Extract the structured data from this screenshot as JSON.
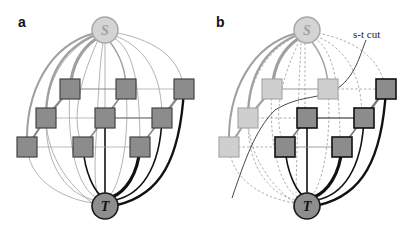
{
  "panels": [
    {
      "id": "a",
      "label": "a",
      "source_label": "S",
      "sink_label": "T",
      "description": "Graph with source S, sink T and a 3x3 grid of pixel nodes; edges to S drawn grey, edges to T drawn black, line thickness encodes edge weight"
    },
    {
      "id": "b",
      "label": "b",
      "source_label": "S",
      "sink_label": "T",
      "cut_label": "s-t cut",
      "description": "Same graph after an s-t cut: nodes on the source side are light grey, nodes on the sink side dark grey; cut edges drawn dashed"
    }
  ],
  "colors": {
    "source_fill": "#d4d4d4",
    "source_stroke": "#a8a8a8",
    "sink_fill": "#8e8e8e",
    "sink_stroke": "#1a1a1a",
    "node_dark": "#8c8c8c",
    "node_light": "#cfcfcf",
    "edge_grey": "#a0a0a0",
    "edge_black": "#111111",
    "dashed": "#9a9a9a"
  }
}
